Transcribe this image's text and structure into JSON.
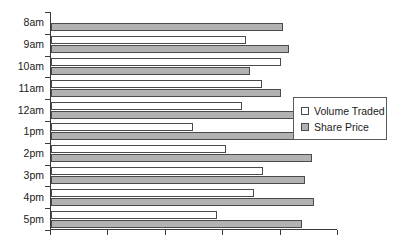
{
  "chart_data": {
    "type": "bar",
    "orientation": "horizontal",
    "title": "",
    "subtitle": "",
    "xlabel": "",
    "ylabel": "",
    "grid": false,
    "xlim": [
      0,
      5
    ],
    "x_tick_values": [
      0,
      1,
      2,
      3,
      4,
      5
    ],
    "x_tick_labels": [
      "",
      "",
      "",
      "",
      "",
      ""
    ],
    "categories": [
      "8am",
      "9am",
      "10am",
      "11am",
      "12am",
      "1pm",
      "2pm",
      "3pm",
      "4pm",
      "5pm"
    ],
    "legend": {
      "position": "right",
      "entries": [
        {
          "name": "Volume Traded",
          "color": "#ffffff"
        },
        {
          "name": "Share Price",
          "color": "#b2b2b2"
        }
      ]
    },
    "series": [
      {
        "name": "Volume Traded",
        "color": "#ffffff",
        "values": [
          0,
          3.39,
          4.01,
          3.68,
          3.32,
          2.48,
          3.05,
          3.7,
          3.53,
          2.89
        ]
      },
      {
        "name": "Share Price",
        "color": "#b2b2b2",
        "values": [
          4.05,
          4.15,
          3.47,
          4.0,
          4.26,
          4.33,
          4.54,
          4.43,
          4.58,
          4.37
        ]
      }
    ]
  },
  "axis": {
    "y_tick_count": 11,
    "x_tick_count": 6
  }
}
